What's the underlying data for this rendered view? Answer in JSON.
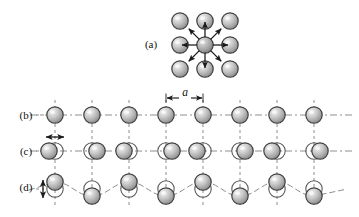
{
  "figure": {
    "type": "lattice-vibration-diagram",
    "width": 359,
    "height": 217,
    "background": "#ffffff"
  },
  "style": {
    "atom_fill_light": "#e8e8e8",
    "atom_fill_mid": "#b5b5b5",
    "atom_fill_dark": "#8a8a8a",
    "atom_stroke": "#3a3a3a",
    "ghost_stroke": "#555555",
    "dash_color": "#8e8e8e",
    "arrow_color": "#1a1a1a",
    "text_color": "#111111",
    "atom_radius": 8.2,
    "ghost_radius": 8.2
  },
  "panels": [
    {
      "id": "a",
      "label": "(a)",
      "label_x": 151,
      "label_y": 48,
      "caption_role": "single atom vibrating about equilibrium among neighbours",
      "grid": {
        "columns_x": [
          180,
          205,
          230
        ],
        "rows_y": [
          21,
          45,
          69
        ],
        "center_x": 205,
        "center_y": 45
      },
      "arrow_count": 8,
      "arrow_length": 15,
      "arrow_inner_gap": 8,
      "arrow_angles_deg": [
        0,
        45,
        90,
        135,
        180,
        225,
        270,
        315
      ]
    },
    {
      "id": "b",
      "label": "(b)",
      "label_x": 26,
      "label_y": 119,
      "caption_role": "undisplaced linear chain at equilibrium spacing a",
      "baseline_y": 115,
      "atoms_x": [
        55,
        92,
        129,
        166,
        203,
        240,
        277,
        314
      ],
      "displacements_x": [
        0,
        0,
        0,
        0,
        0,
        0,
        0,
        0
      ],
      "displacements_y": [
        0,
        0,
        0,
        0,
        0,
        0,
        0,
        0
      ],
      "show_ghosts": false
    },
    {
      "id": "c",
      "label": "(c)",
      "label_x": 26,
      "label_y": 155,
      "caption_role": "longitudinal wave: atoms displaced along the chain axis",
      "baseline_y": 151,
      "atoms_x": [
        55,
        92,
        129,
        166,
        203,
        240,
        277,
        314
      ],
      "displacements_x": [
        -6,
        5,
        -5,
        6,
        -6,
        5,
        -5,
        6
      ],
      "displacements_y": [
        0,
        0,
        0,
        0,
        0,
        0,
        0,
        0
      ],
      "show_ghosts": true
    },
    {
      "id": "d",
      "label": "(d)",
      "label_x": 26,
      "label_y": 191,
      "caption_role": "transverse wave: atoms displaced perpendicular to the chain",
      "baseline_y": 189,
      "atoms_x": [
        55,
        92,
        129,
        166,
        203,
        240,
        277,
        314
      ],
      "displacements_x": [
        0,
        0,
        0,
        0,
        0,
        0,
        0,
        0
      ],
      "displacements_y": [
        -7,
        7,
        -7,
        7,
        -7,
        7,
        -7,
        7
      ],
      "show_ghosts": true,
      "wave_curve": true
    }
  ],
  "annotations": {
    "lattice_constant": {
      "symbol": "a",
      "text_x": 185,
      "text_y": 96,
      "arrow_left_x": 166,
      "arrow_right_x": 203,
      "arrow_y": 98
    },
    "longitudinal_arrow": {
      "cx": 55,
      "cy": 137,
      "half_length": 9,
      "orientation": "horizontal"
    },
    "transverse_arrow": {
      "cx": 43,
      "cy": 189,
      "half_length": 9,
      "orientation": "vertical"
    }
  },
  "gridlines": {
    "x_positions": [
      55,
      92,
      129,
      166,
      203,
      240,
      277,
      314
    ],
    "y_top": 100,
    "y_bottom": 207,
    "dash_pattern": "3,3"
  },
  "baselines": [
    {
      "panel": "b",
      "y": 115,
      "x_start": 30,
      "x_end": 352,
      "dash_pattern": "7,3,2,3"
    },
    {
      "panel": "c",
      "y": 151,
      "x_start": 30,
      "x_end": 352,
      "dash_pattern": "7,3,2,3"
    }
  ]
}
